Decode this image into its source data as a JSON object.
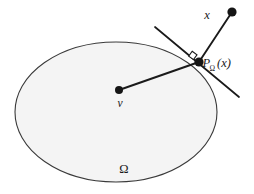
{
  "figure": {
    "type": "geometry-diagram",
    "background_color": "#ffffff",
    "set_fill_color": "#f4f4f4",
    "stroke_color": "#3a3a3a",
    "line_color": "#1a1a1a",
    "labels": {
      "point_x": "x",
      "point_v": "v",
      "set_omega": "Ω",
      "projection_base": "P",
      "projection_subscript": "Ω",
      "projection_argument": "(x)"
    },
    "geometry": {
      "ellipse": {
        "cx": 116,
        "cy": 112,
        "rx": 101,
        "ry": 70
      },
      "point_x": {
        "x": 232,
        "y": 12,
        "r": 4.6
      },
      "point_v": {
        "x": 119,
        "y": 90,
        "r": 4.0
      },
      "point_projection": {
        "x": 199,
        "y": 62,
        "r": 4.6
      },
      "tangent_line": {
        "x1": 155,
        "y1": 27,
        "x2": 239,
        "y2": 97
      },
      "segment_x_to_projection": {
        "x1": 232,
        "y1": 12,
        "x2": 199,
        "y2": 62
      },
      "segment_v_to_projection": {
        "x1": 119,
        "y1": 90,
        "x2": 199,
        "y2": 62
      },
      "right_angle_marker": {
        "cx": 193,
        "cy": 56,
        "size": 7
      }
    },
    "label_positions": {
      "point_x": {
        "x": 207,
        "y": 19
      },
      "point_v": {
        "x": 120,
        "y": 106
      },
      "set_omega": {
        "x": 124,
        "y": 172
      },
      "projection_base": {
        "x": 203,
        "y": 66
      },
      "projection_subscript": {
        "x": 210,
        "y": 70
      },
      "projection_argument": {
        "x": 217,
        "y": 66
      }
    }
  }
}
